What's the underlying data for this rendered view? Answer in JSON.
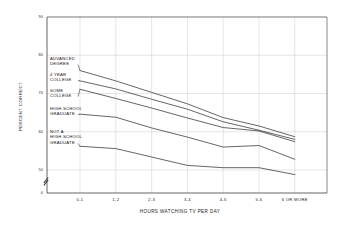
{
  "chart_data": {
    "type": "line",
    "title": "",
    "xlabel": "HOURS WATCHING TV PER DAY",
    "ylabel": "PERCENT CORRECT",
    "categories": [
      "0-1",
      "1-2",
      "2-3",
      "3-4",
      "4-5",
      "5-6",
      "6 OR MORE"
    ],
    "yticks": [
      50,
      60,
      70,
      80,
      90
    ],
    "ylim": [
      45,
      90
    ],
    "xlim": [
      0,
      6
    ],
    "grid": true,
    "axis_break": true,
    "legend_position": "inline-left",
    "axis_color": "#555555",
    "grid_color": "#cccccc",
    "line_color": "#333333",
    "series": [
      {
        "name": "ADVANCED DEGREE",
        "label_lines": [
          "ADVANCED",
          "DEGREE"
        ],
        "values": [
          76.0,
          73.3,
          70.3,
          67.3,
          63.7,
          61.5,
          58.7
        ]
      },
      {
        "name": "4 YEAR COLLEGE",
        "label_lines": [
          "4 YEAR",
          "COLLEGE"
        ],
        "values": [
          73.3,
          71.2,
          68.5,
          65.9,
          62.6,
          60.4,
          58.0
        ]
      },
      {
        "name": "SOME COLLEGE",
        "label_lines": [
          "SOME",
          "COLLEGE"
        ],
        "values": [
          71.1,
          68.7,
          66.2,
          63.6,
          61.1,
          60.2,
          57.4
        ]
      },
      {
        "name": "HIGH SCHOOL GRADUATE",
        "label_lines": [
          "HIGH SCHOOL",
          "GRADUATE"
        ],
        "values": [
          64.6,
          63.8,
          61.0,
          58.6,
          56.0,
          56.4,
          52.8
        ]
      },
      {
        "name": "NOT A HIGH SCHOOL GRADUATE",
        "label_lines": [
          "NOT A",
          "HIGH SCHOOL",
          "GRADUATE"
        ],
        "values": [
          56.2,
          55.6,
          53.4,
          51.2,
          50.6,
          50.6,
          48.8
        ]
      }
    ]
  },
  "ytick_labels": [
    "90",
    "80",
    "70",
    "60",
    "50",
    "0"
  ],
  "axis": {
    "y_title": "PERCENT CORRECT",
    "x_title": "HOURS WATCHING TV PER DAY"
  }
}
